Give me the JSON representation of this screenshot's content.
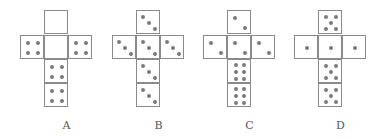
{
  "figure": {
    "nets": [
      {
        "label": "A",
        "offset_x": 20,
        "faces": [
          {
            "pos": "top",
            "pips": 0
          },
          {
            "pos": "left",
            "pips": 4
          },
          {
            "pos": "center",
            "pips": 0
          },
          {
            "pos": "right",
            "pips": 4
          },
          {
            "pos": "below1",
            "pips": 4
          },
          {
            "pos": "below2",
            "pips": 4
          }
        ]
      },
      {
        "label": "B",
        "offset_x": 112,
        "faces": [
          {
            "pos": "top",
            "pips": 3
          },
          {
            "pos": "left",
            "pips": 3
          },
          {
            "pos": "center",
            "pips": 3
          },
          {
            "pos": "right",
            "pips": 3
          },
          {
            "pos": "below1",
            "pips": 3
          },
          {
            "pos": "below2",
            "pips": 3
          }
        ]
      },
      {
        "label": "C",
        "offset_x": 203,
        "faces": [
          {
            "pos": "top",
            "pips": 2
          },
          {
            "pos": "left",
            "pips": 2
          },
          {
            "pos": "center",
            "pips": 2
          },
          {
            "pos": "right",
            "pips": 2
          },
          {
            "pos": "below1",
            "pips": 6
          },
          {
            "pos": "below2",
            "pips": 6
          }
        ]
      },
      {
        "label": "D",
        "offset_x": 294,
        "faces": [
          {
            "pos": "top",
            "pips": 5
          },
          {
            "pos": "left",
            "pips": 1
          },
          {
            "pos": "center",
            "pips": 1
          },
          {
            "pos": "right",
            "pips": 1
          },
          {
            "pos": "below1",
            "pips": 5
          },
          {
            "pos": "below2",
            "pips": 5
          }
        ]
      }
    ],
    "colors": {
      "outline": "#8a8a8a",
      "pip": "#7a7a7a",
      "label": "#555555"
    }
  }
}
